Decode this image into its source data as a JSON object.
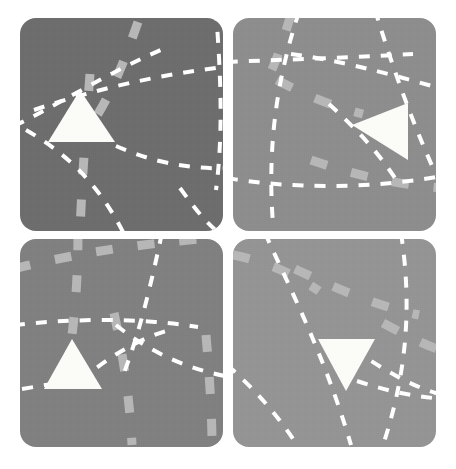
{
  "canvas": {
    "width": 456,
    "height": 469,
    "background_color": "#ffffff",
    "title": "Four-panel gray tiles with white triangles and dashed paths"
  },
  "palette": {
    "panel_dark": "#6d6d6d",
    "panel_mid": "#808080",
    "panel_light": "#8d8d8d",
    "panel_lighter": "#949494",
    "triangle_fill": "#fbfbf8",
    "thin_dash_stroke": "#ffffff",
    "thick_dash_stroke": "#b7b7b7"
  },
  "panels": [
    {
      "id": "panel-top-left",
      "position_label": "top-left",
      "x": 20,
      "y": 18,
      "width": 203,
      "height": 213,
      "fill": "#6d6d6d",
      "corner_radius": 16,
      "triangle": {
        "name": "triangle-up",
        "direction": "up",
        "points": "60,72 28,124 95,124",
        "fill": "#fbfbf8",
        "rotation_deg": 0
      },
      "thin_dashes": [
        "M -6,108 C 40,86 92,52 150,28",
        "M 14,92 C 72,72 140,56 212,48",
        "M 196,-8 C 200,50 204,110 196,172",
        "M 6,112 C 44,134 78,164 104,216",
        "M 96,128 C 128,142 164,152 212,150",
        "M 160,170 C 176,192 188,208 206,220"
      ],
      "thick_dashes": [
        "M 118,4 C 104,44 90,82 62,120",
        "M 70,56 C 66,108 62,160 60,214"
      ]
    },
    {
      "id": "panel-top-right",
      "position_label": "top-right",
      "x": 233,
      "y": 18,
      "width": 203,
      "height": 213,
      "fill": "#8d8d8d",
      "corner_radius": 16,
      "triangle": {
        "name": "triangle-left",
        "direction": "left",
        "points": "119,107 175,85 175,142",
        "fill": "#fbfbf8",
        "rotation_deg": 90
      },
      "thin_dashes": [
        "M -6,44 C 40,42 110,40 180,36",
        "M 66,-6 C 44,60 34,128 40,206",
        "M 58,36 C 104,42 150,54 206,70",
        "M 142,-8 C 158,44 176,96 200,150",
        "M -6,160 C 54,170 130,172 210,158",
        "M 96,86 C 120,108 142,130 162,160"
      ],
      "thick_dashes": [
        "M 58,-4 C 50,24 42,48 30,70",
        "M 44,62 C 70,76 98,88 130,96",
        "M 78,142 C 118,156 160,166 208,170"
      ]
    },
    {
      "id": "panel-bottom-left",
      "position_label": "bottom-left",
      "x": 20,
      "y": 239,
      "width": 203,
      "height": 208,
      "fill": "#808080",
      "corner_radius": 16,
      "triangle": {
        "name": "triangle-up",
        "direction": "up",
        "points": "52,100 24,150 82,150",
        "fill": "#fbfbf8",
        "rotation_deg": 0
      },
      "thin_dashes": [
        "M -6,86 C 50,80 116,78 178,88",
        "M 142,-6 C 132,40 122,86 104,134",
        "M 96,86 C 128,112 166,130 210,138",
        "M 60,142 C 86,120 114,102 146,92",
        "M 2,150 C 26,146 48,142 72,140"
      ],
      "thick_dashes": [
        "M -6,30 C 48,16 110,6 180,0",
        "M 58,-6 C 58,30 56,64 52,96",
        "M 94,74 C 104,120 110,164 112,206",
        "M 186,96 C 190,142 192,180 192,206"
      ]
    },
    {
      "id": "panel-bottom-right",
      "position_label": "bottom-right",
      "x": 233,
      "y": 239,
      "width": 203,
      "height": 208,
      "fill": "#949494",
      "corner_radius": 16,
      "triangle": {
        "name": "triangle-down",
        "direction": "down",
        "points": "85,100 142,100 113,152",
        "fill": "#fbfbf8",
        "rotation_deg": 180
      },
      "thin_dashes": [
        "M 32,-6 C 60,56 92,118 118,206",
        "M -6,126 C 22,150 46,178 64,206",
        "M 168,-6 C 178,60 176,128 150,206",
        "M 120,110 C 150,130 178,148 210,156",
        "M 124,142 C 154,152 182,158 212,160"
      ],
      "thick_dashes": [
        "M 0,16 C 30,22 60,34 86,52",
        "M 62,30 C 100,48 140,66 186,76",
        "M 150,84 C 172,96 192,106 210,112"
      ]
    }
  ],
  "dash_style": {
    "thin_dash_width": 4,
    "thin_dash_array": "11 11",
    "thick_dash_width": 9,
    "thick_dash_array": "17 25"
  }
}
